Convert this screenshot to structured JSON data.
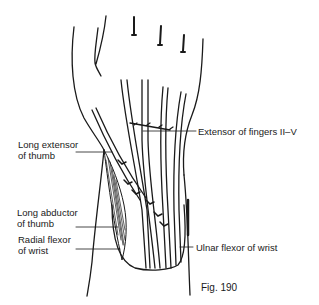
{
  "figure": {
    "caption": "Fig. 190"
  },
  "labels": [
    {
      "id": "extensor-fingers",
      "lines": [
        "Extensor of fingers II–V"
      ]
    },
    {
      "id": "long-extensor-thumb",
      "lines": [
        "Long extensor",
        "of thumb"
      ]
    },
    {
      "id": "long-abductor-thumb",
      "lines": [
        "Long abductor",
        "of thumb"
      ]
    },
    {
      "id": "radial-flexor-wrist",
      "lines": [
        "Radial flexor",
        "of wrist"
      ]
    },
    {
      "id": "ulnar-flexor-wrist",
      "lines": [
        "Ulnar flexor of wrist"
      ]
    }
  ],
  "colors": {
    "ink": "#1a1a1a",
    "background": "#ffffff"
  }
}
